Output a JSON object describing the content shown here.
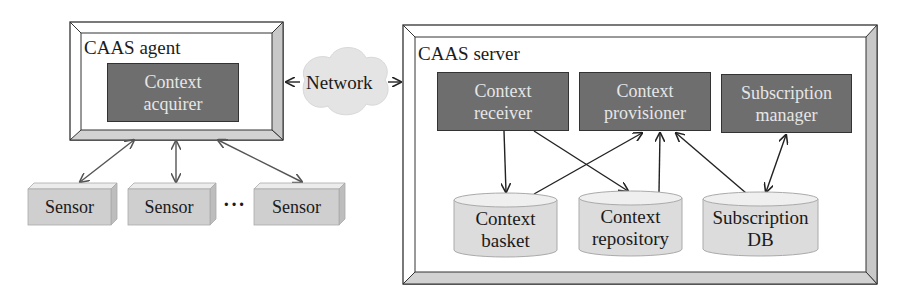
{
  "agent": {
    "title": "CAAS agent",
    "component": {
      "line1": "Context",
      "line2": "acquirer"
    }
  },
  "network": {
    "label": "Network"
  },
  "server": {
    "title": "CAAS server",
    "components": [
      {
        "line1": "Context",
        "line2": "receiver"
      },
      {
        "line1": "Context",
        "line2": "provisioner"
      },
      {
        "line1": "Subscription",
        "line2": "manager"
      }
    ],
    "stores": [
      {
        "line1": "Context",
        "line2": "basket"
      },
      {
        "line1": "Context",
        "line2": "repository"
      },
      {
        "line1": "Subscription",
        "line2": "DB"
      }
    ]
  },
  "sensors": [
    {
      "label": "Sensor"
    },
    {
      "label": "Sensor"
    },
    {
      "label": "Sensor"
    }
  ],
  "ellipsis": "···",
  "colors": {
    "component_fill": "#6e6e6e",
    "component_text": "#e6e6e6",
    "bevel": "#c8c8c8",
    "store_fill": "#dedede",
    "sensor_fill": "#cfcfcf",
    "cloud": "#e4e4e4",
    "line": "#222222"
  }
}
